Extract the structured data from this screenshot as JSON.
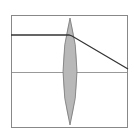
{
  "diagram": {
    "type": "optics-ray-diagram",
    "frame": {
      "x": 11,
      "y": 15,
      "width": 117,
      "height": 113,
      "stroke": "#888888"
    },
    "optical_axis": {
      "y": 72,
      "stroke": "#999999"
    },
    "lens": {
      "cx": 70,
      "top": 18,
      "bottom": 125,
      "half_width": 7,
      "fill": "#b8b8b8",
      "stroke": "#777777"
    },
    "ray": {
      "points": [
        [
          11,
          35
        ],
        [
          69,
          35
        ],
        [
          72,
          36
        ],
        [
          128,
          69
        ]
      ],
      "stroke": "#333333"
    }
  }
}
